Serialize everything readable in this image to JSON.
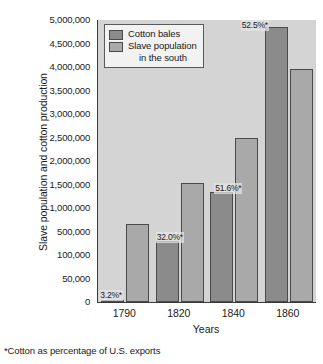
{
  "chart_data": {
    "type": "bar",
    "title": "",
    "xlabel": "Years",
    "ylabel": "Slave population and cotton production",
    "categories": [
      "1790",
      "1820",
      "1840",
      "1860"
    ],
    "series": [
      {
        "name": "Cotton bales",
        "color": "#8b8b8b",
        "values": [
          3000,
          335000,
          1350000,
          4860000
        ]
      },
      {
        "name": "Slave population in the south",
        "color": "#a9a9a9",
        "values": [
          657000,
          1538000,
          2487000,
          3954000
        ]
      }
    ],
    "y_ticks": [
      "0",
      "50,000",
      "100,000",
      "500,000",
      "1,000,000",
      "1,500,000",
      "2,000,000",
      "2,500,000",
      "3,000,000",
      "3,500,000",
      "4,000,000",
      "4,500,000",
      "5,000,000"
    ],
    "y_tick_values": [
      0,
      50000,
      100000,
      500000,
      1000000,
      1500000,
      2000000,
      2500000,
      3000000,
      3500000,
      4000000,
      4500000,
      5000000
    ],
    "y_axis_scale": "non-linear (equal spacing between listed ticks)",
    "annotations": [
      {
        "category": "1790",
        "text": "3.2%*",
        "value": 3.2
      },
      {
        "category": "1820",
        "text": "32.0%*",
        "value": 32.0
      },
      {
        "category": "1840",
        "text": "51.6%*",
        "value": 51.6
      },
      {
        "category": "1860",
        "text": "52.5%*",
        "value": 52.5
      }
    ],
    "grid": false,
    "legend_position": "top-left-inside",
    "footnote": "*Cotton as percentage of U.S. exports",
    "plot_background": "#d4d4d4"
  },
  "legend": {
    "entries": [
      {
        "label": "Cotton bales",
        "label_cont": ""
      },
      {
        "label": "Slave population",
        "label_cont": "in the south"
      }
    ]
  },
  "axes": {
    "y_title": "Slave population and cotton production",
    "x_title": "Years"
  },
  "footnote": {
    "text": "*Cotton as percentage of U.S. exports"
  }
}
